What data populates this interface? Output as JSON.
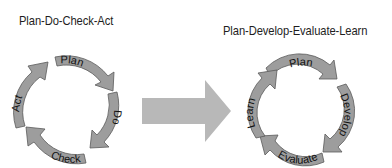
{
  "header": {
    "fragment": ""
  },
  "left_cycle": {
    "title": "Plan-Do-Check-Act",
    "steps": [
      "Plan",
      "Do",
      "Check",
      "Act"
    ]
  },
  "right_cycle": {
    "title": "Plan-Develop-Evaluate-Learn",
    "steps": [
      "Plan",
      "Develop",
      "Evaluate",
      "Learn"
    ]
  },
  "transition_arrow": {
    "direction": "right"
  },
  "colors": {
    "segment_fill": "#9d9d9d",
    "segment_stroke": "#5a5a5a",
    "transition_arrow": "#b8b8b8",
    "text": "#1e1e1e"
  }
}
